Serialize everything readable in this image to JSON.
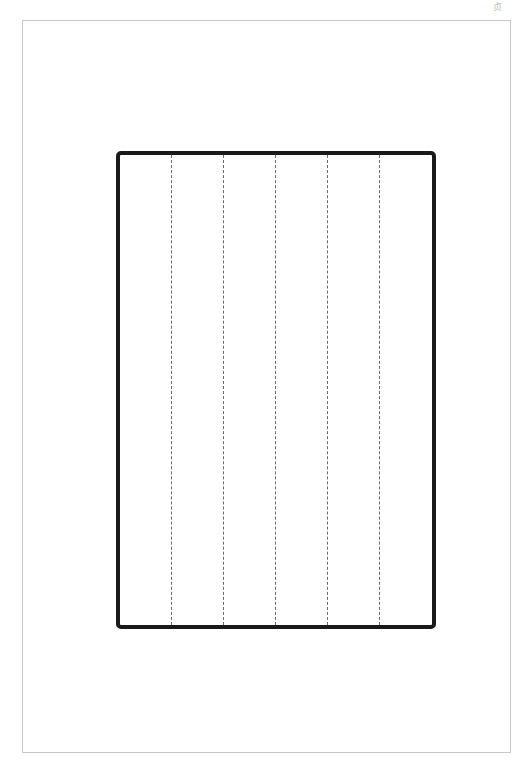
{
  "page": {
    "corner_mark": "贞",
    "frame_color": "#c8c8c8",
    "border_color": "#1a1a1a"
  },
  "ruled_box": {
    "columns": 6,
    "column_lines_x": [
      171,
      223,
      275,
      327,
      379
    ],
    "cells": [
      "",
      "",
      "",
      "",
      "",
      ""
    ]
  }
}
